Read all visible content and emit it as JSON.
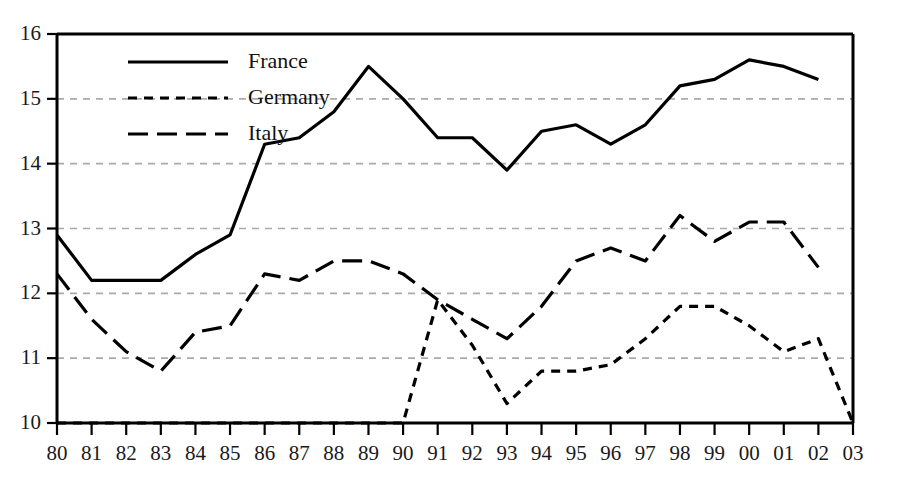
{
  "chart_data": {
    "type": "line",
    "title": "",
    "subtitle": "",
    "xlabel": "",
    "ylabel": "",
    "xlim": [
      1980,
      2003
    ],
    "ylim": [
      10,
      16
    ],
    "yticks": [
      10,
      11,
      12,
      13,
      14,
      15,
      16
    ],
    "ytick_labels": [
      "10",
      "11",
      "12",
      "13",
      "14",
      "15",
      "16"
    ],
    "x": [
      1980,
      1981,
      1982,
      1983,
      1984,
      1985,
      1986,
      1987,
      1988,
      1989,
      1990,
      1991,
      1992,
      1993,
      1994,
      1995,
      1996,
      1997,
      1998,
      1999,
      2000,
      2001,
      2002,
      2003
    ],
    "xtick_labels": [
      "80",
      "81",
      "82",
      "83",
      "84",
      "85",
      "86",
      "87",
      "88",
      "89",
      "90",
      "91",
      "92",
      "93",
      "94",
      "95",
      "96",
      "97",
      "98",
      "99",
      "00",
      "01",
      "02",
      "03"
    ],
    "grid": true,
    "grid_axis": "y",
    "grid_style": "dashed",
    "grid_color": "#aaaaaa",
    "legend_position": "top-left",
    "series": [
      {
        "name": "France",
        "style": "solid",
        "color": "#000000",
        "values": [
          12.9,
          12.2,
          12.2,
          12.2,
          12.6,
          12.9,
          14.3,
          14.4,
          14.8,
          15.5,
          15.0,
          14.4,
          14.4,
          13.9,
          14.5,
          14.6,
          14.3,
          14.6,
          15.2,
          15.3,
          15.6,
          15.5,
          15.3,
          null
        ]
      },
      {
        "name": "Germany",
        "style": "short-dash",
        "color": "#000000",
        "values": [
          10.0,
          10.0,
          10.0,
          10.0,
          10.0,
          10.0,
          10.0,
          10.0,
          10.0,
          10.0,
          10.0,
          11.9,
          11.2,
          10.3,
          10.8,
          10.8,
          10.9,
          11.3,
          11.8,
          11.8,
          11.5,
          11.1,
          11.3,
          10.0
        ]
      },
      {
        "name": "Italy",
        "style": "long-dash",
        "color": "#000000",
        "values": [
          12.3,
          11.6,
          11.1,
          10.8,
          11.4,
          11.5,
          12.3,
          12.2,
          12.5,
          12.5,
          12.3,
          11.9,
          11.6,
          11.3,
          11.8,
          12.5,
          12.7,
          12.5,
          13.2,
          12.8,
          13.1,
          13.1,
          12.4,
          null
        ]
      }
    ]
  },
  "legend": {
    "items": [
      {
        "label": "France",
        "style": "solid"
      },
      {
        "label": "Germany",
        "style": "short-dash"
      },
      {
        "label": "Italy",
        "style": "long-dash"
      }
    ]
  },
  "axes": {
    "y_axis_name": "value-axis",
    "x_axis_name": "year-axis"
  }
}
